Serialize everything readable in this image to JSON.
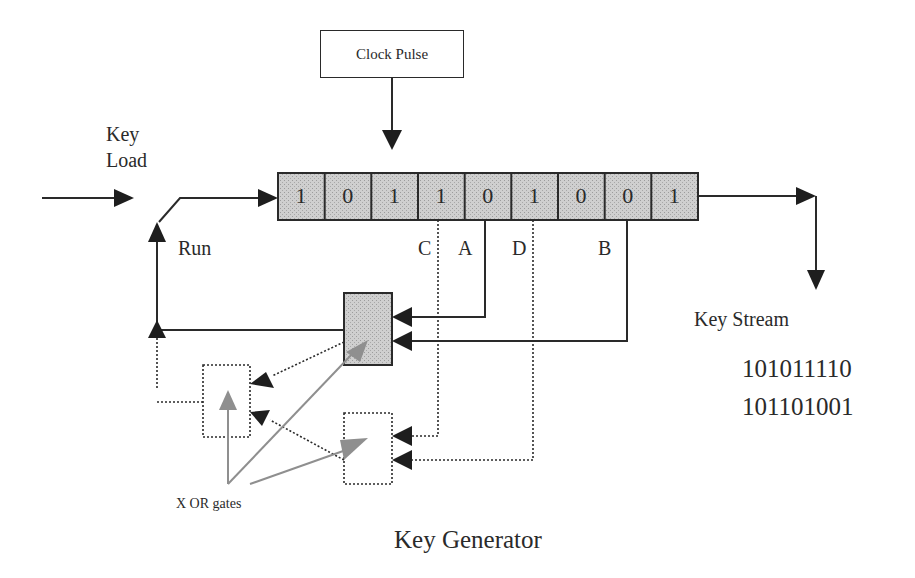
{
  "title": "Key Generator",
  "clock": {
    "label": "Clock Pulse"
  },
  "inputs": {
    "key_load": [
      "Key",
      "Load"
    ],
    "run": "Run"
  },
  "register": {
    "bits": [
      "1",
      "0",
      "1",
      "1",
      "0",
      "1",
      "0",
      "0",
      "1"
    ],
    "fill_color": "#c8c8c8"
  },
  "taps": {
    "C": "C",
    "A": "A",
    "D": "D",
    "B": "B"
  },
  "output": {
    "label": "Key Stream",
    "stream_lines": [
      "101011110",
      "101101001"
    ]
  },
  "annotation": {
    "xor_label": "X OR gates"
  },
  "colors": {
    "line": "#2a2a2a",
    "gate_fill": "#c8c8c8",
    "pointer": "#8f8f8f"
  }
}
